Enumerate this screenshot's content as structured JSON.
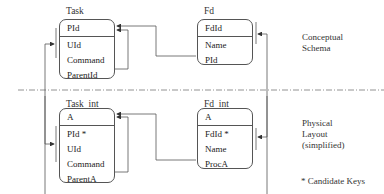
{
  "conceptual": {
    "label": "Conceptual\nSchema",
    "task": {
      "title": "Task",
      "key": "PId",
      "attributes": [
        "UId",
        "Command",
        "ParentId"
      ]
    },
    "fd": {
      "title": "Fd",
      "key": "FdId",
      "attributes": [
        "Name",
        "PId"
      ]
    }
  },
  "physical": {
    "label": "Physical\nLayout\n(simplified)",
    "task_int": {
      "title": "Task_int",
      "key": "A",
      "attributes": [
        "PId *",
        "UId",
        "Command",
        "ParentA"
      ]
    },
    "fd_int": {
      "title": "Fd_int",
      "key": "A",
      "attributes": [
        "FdId *",
        "Name",
        "ProcA"
      ]
    }
  },
  "footnote": "* Candidate Keys",
  "colors": {
    "line": "#555555",
    "divider": "#777777"
  }
}
